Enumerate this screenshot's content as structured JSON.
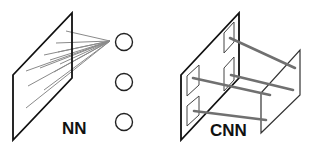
{
  "diagram": {
    "left": {
      "label": "NN",
      "description": "Fully connected: every input pixel connects to the neuron",
      "neurons": 3
    },
    "right": {
      "label": "CNN",
      "description": "Convolutional: local receptive fields connect to next layer",
      "receptive_fields": 4
    },
    "colors": {
      "outline": "#111111",
      "connection": "#808080",
      "background": "#ffffff"
    }
  }
}
